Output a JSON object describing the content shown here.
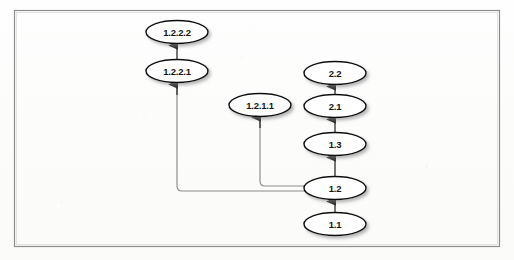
{
  "figure": {
    "kind": "revision-tree-diagram",
    "caption": "",
    "border": {
      "x": 14,
      "y": 10,
      "width": 486,
      "height": 237,
      "color": "#8d8d8d"
    },
    "background_color": "#fdfdfc",
    "node_style": {
      "shape": "ellipse",
      "rx": 31,
      "ry": 11.5,
      "fill": "#ffffff",
      "stroke": "#111111",
      "text_color": "#141414",
      "shadow_color": "#b9b9b9"
    },
    "edge_style": {
      "color": "#3a3a3a",
      "elbow_color": "#8a8a8a",
      "arrowhead": "filled-triangle-up"
    }
  },
  "nodes": [
    {
      "id": "1.2.2.2",
      "label": "1.2.2.2",
      "cx": 177,
      "cy": 32
    },
    {
      "id": "1.2.2.1",
      "label": "1.2.2.1",
      "cx": 177,
      "cy": 71
    },
    {
      "id": "1.2.1.1",
      "label": "1.2.1.1",
      "cx": 260,
      "cy": 105
    },
    {
      "id": "2.2",
      "label": "2.2",
      "cx": 335,
      "cy": 73
    },
    {
      "id": "2.1",
      "label": "2.1",
      "cx": 335,
      "cy": 106
    },
    {
      "id": "1.3",
      "label": "1.3",
      "cx": 335,
      "cy": 144
    },
    {
      "id": "1.2",
      "label": "1.2",
      "cx": 335,
      "cy": 188
    },
    {
      "id": "1.1",
      "label": "1.1",
      "cx": 335,
      "cy": 224
    }
  ],
  "edges": [
    {
      "from": "1.1",
      "to": "1.2",
      "type": "straight-up"
    },
    {
      "from": "1.2",
      "to": "1.3",
      "type": "straight-up"
    },
    {
      "from": "1.3",
      "to": "2.1",
      "type": "straight-up"
    },
    {
      "from": "2.1",
      "to": "2.2",
      "type": "straight-up"
    },
    {
      "from": "1.2",
      "to": "1.2.1.1",
      "type": "elbow-left-up"
    },
    {
      "from": "1.2",
      "to": "1.2.2.1",
      "type": "elbow-left-up"
    },
    {
      "from": "1.2.2.1",
      "to": "1.2.2.2",
      "type": "straight-up"
    }
  ]
}
